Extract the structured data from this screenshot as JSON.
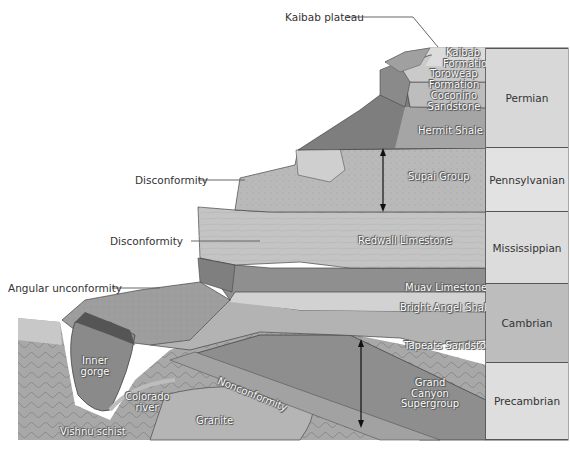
{
  "diagram": {
    "callouts": [
      {
        "id": "kaibab-plateau",
        "text": "Kaibab plateau"
      },
      {
        "id": "disconformity-upper",
        "text": "Disconformity"
      },
      {
        "id": "disconformity-lower",
        "text": "Disconformity"
      },
      {
        "id": "angular-unconformity",
        "text": "Angular unconformity"
      }
    ],
    "rock_units": [
      {
        "id": "kaibab",
        "text": "Kaibab Formation"
      },
      {
        "id": "toroweap",
        "text": "Toroweap Formation"
      },
      {
        "id": "coconino",
        "text": "Coconino Sandstone"
      },
      {
        "id": "hermit",
        "text": "Hermit Shale"
      },
      {
        "id": "supai",
        "text": "Supai Group"
      },
      {
        "id": "redwall",
        "text": "Redwall Limestone"
      },
      {
        "id": "muav",
        "text": "Muav Limestone"
      },
      {
        "id": "bright-angel",
        "text": "Bright Angel Shale"
      },
      {
        "id": "tapeats",
        "text": "Tapeats Sandstone"
      },
      {
        "id": "grand-canyon-supergroup",
        "text": "Grand Canyon Supergroup"
      },
      {
        "id": "nonconformity",
        "text": "Nonconformity"
      },
      {
        "id": "granite",
        "text": "Granite"
      },
      {
        "id": "vishnu",
        "text": "Vishnu schist"
      },
      {
        "id": "inner-gorge",
        "text": "Inner gorge"
      },
      {
        "id": "colorado-river",
        "text": "Colorado river"
      }
    ],
    "periods": [
      {
        "id": "permian",
        "text": "Permian",
        "color": "#d8d8d8"
      },
      {
        "id": "pennsylvanian",
        "text": "Pennsylvanian",
        "color": "#e2e2e2"
      },
      {
        "id": "mississippian",
        "text": "Mississippian",
        "color": "#dcdcdc"
      },
      {
        "id": "cambrian",
        "text": "Cambrian",
        "color": "#bdbdbd"
      },
      {
        "id": "precambrian",
        "text": "Precambrian",
        "color": "#dedede"
      }
    ]
  },
  "labels": {
    "kaibab_plateau": "Kaibab plateau",
    "disconformity_1": "Disconformity",
    "disconformity_2": "Disconformity",
    "angular_unconformity": "Angular unconformity",
    "kaibab_l1": "Kaibab",
    "kaibab_l2": "Formation",
    "toroweap_l1": "Toroweap",
    "toroweap_l2": "Formation",
    "coconino_l1": "Coconino",
    "coconino_l2": "Sandstone",
    "hermit": "Hermit Shale",
    "supai": "Supai Group",
    "redwall": "Redwall Limestone",
    "muav": "Muav Limestone",
    "bright_angel": "Bright Angel Shale",
    "tapeats": "Tapeats Sandstone",
    "gcs_l1": "Grand",
    "gcs_l2": "Canyon",
    "gcs_l3": "Supergroup",
    "nonconformity": "Nonconformity",
    "granite": "Granite",
    "vishnu": "Vishnu schist",
    "inner_l1": "Inner",
    "inner_l2": "gorge",
    "colorado_l1": "Colorado",
    "colorado_l2": "river",
    "permian": "Permian",
    "pennsylvanian": "Pennsylvanian",
    "mississippian": "Mississippian",
    "cambrian": "Cambrian",
    "precambrian": "Precambrian"
  }
}
